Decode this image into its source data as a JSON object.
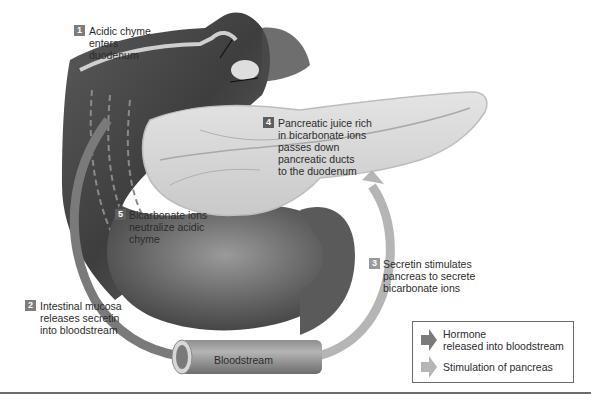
{
  "diagram": {
    "colors": {
      "background": "#ffffff",
      "hormone_arrow": "#7a7a7a",
      "stimulation_arrow": "#b5b5b5",
      "badge": "#7d7d7d",
      "text": "#2b2b2b",
      "legend_border": "#6a6a6a",
      "rule": "#6b6b6b"
    },
    "steps": [
      {
        "number": "1",
        "lines": [
          "Acidic chyme",
          "enters",
          "duodenum"
        ]
      },
      {
        "number": "2",
        "lines": [
          "Intestinal mucosa",
          "releases secretin",
          "into bloodstream"
        ]
      },
      {
        "number": "3",
        "lines": [
          "Secretin stimulates",
          "pancreas to secrete",
          "bicarbonate ions"
        ]
      },
      {
        "number": "4",
        "lines": [
          "Pancreatic juice rich",
          "in bicarbonate ions",
          "passes down",
          "pancreatic ducts",
          "to the duodenum"
        ]
      },
      {
        "number": "5",
        "lines": [
          "Bicarbonate ions",
          "neutralize acidic",
          "chyme"
        ]
      }
    ],
    "structures": {
      "bloodstream": "Bloodstream",
      "organs": [
        "stomach",
        "duodenum",
        "pancreas"
      ]
    },
    "legend": {
      "items": [
        {
          "icon": "dark-arrow",
          "lines": [
            "Hormone",
            "released into bloodstream"
          ]
        },
        {
          "icon": "light-arrow",
          "lines": [
            "Stimulation of pancreas"
          ]
        }
      ]
    }
  }
}
